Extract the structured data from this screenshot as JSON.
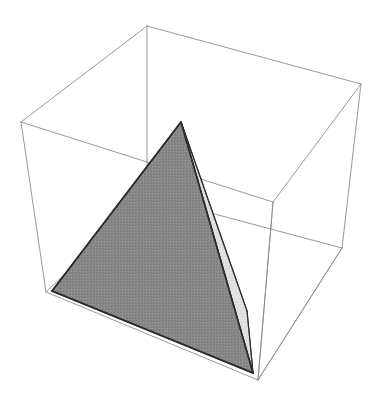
{
  "figure": {
    "title": "Tetrahedron inscribed in a wireframe bounding box",
    "type": "3d-geometry-render",
    "canvas": {
      "width": 381,
      "height": 401,
      "background": "#ffffff"
    },
    "colors": {
      "background": "#ffffff",
      "wireframe_stroke": "#8d8d8d",
      "solid_outline": "#2b2b2b",
      "face_dark_fill": "#848484",
      "face_light_fill": "#e9e9e9",
      "face_mid_fill": "#d2d2d2"
    },
    "stroke_widths": {
      "wireframe": 0.9,
      "solid_outline": 1.5
    },
    "bounding_box": {
      "name": "wireframe-cube",
      "vertices": {
        "top_back": [
          147,
          26
        ],
        "top_left": [
          21,
          122
        ],
        "top_right": [
          361,
          84
        ],
        "top_front": [
          273,
          202
        ],
        "bottom_left": [
          46,
          292
        ],
        "bottom_right": [
          342,
          248
        ],
        "bottom_front": [
          258,
          380
        ],
        "bottom_back": [
          147,
          196
        ]
      },
      "edges": [
        [
          "top_back",
          "top_left"
        ],
        [
          "top_back",
          "top_right"
        ],
        [
          "top_left",
          "top_front"
        ],
        [
          "top_right",
          "top_front"
        ],
        [
          "top_left",
          "bottom_left"
        ],
        [
          "top_right",
          "bottom_right"
        ],
        [
          "top_front",
          "bottom_front"
        ],
        [
          "bottom_left",
          "bottom_front"
        ],
        [
          "bottom_right",
          "bottom_front"
        ],
        [
          "top_back",
          "bottom_back"
        ],
        [
          "bottom_back",
          "bottom_left"
        ],
        [
          "bottom_back",
          "bottom_right"
        ]
      ]
    },
    "tetrahedron": {
      "name": "shaded-tetrahedron",
      "vertices": {
        "apex": [
          181,
          122
        ],
        "base_left": [
          52,
          291
        ],
        "base_front": [
          253,
          373
        ],
        "base_right": [
          247,
          311
        ]
      },
      "faces": [
        {
          "name": "face-front-left",
          "shade": "dark",
          "points": [
            [
              181,
              122
            ],
            [
              52,
              291
            ],
            [
              253,
              373
            ]
          ]
        },
        {
          "name": "face-right",
          "shade": "light",
          "points": [
            [
              181,
              122
            ],
            [
              253,
              373
            ],
            [
              247,
              311
            ]
          ]
        },
        {
          "name": "face-right-inner",
          "shade": "mid",
          "points": [
            [
              181,
              122
            ],
            [
              247,
              311
            ],
            [
              253,
              373
            ]
          ]
        }
      ],
      "visible_edges": [
        [
          [
            181,
            122
          ],
          [
            52,
            291
          ]
        ],
        [
          [
            52,
            291
          ],
          [
            253,
            373
          ]
        ],
        [
          [
            181,
            122
          ],
          [
            253,
            373
          ]
        ],
        [
          [
            181,
            122
          ],
          [
            247,
            311
          ]
        ],
        [
          [
            247,
            311
          ],
          [
            253,
            373
          ]
        ]
      ]
    }
  },
  "chart_data": {
    "type": "scatter",
    "title": "Tetrahedron inscribed in a wireframe bounding box",
    "xlabel": "",
    "ylabel": "",
    "series": [
      {
        "name": "cube-vertices",
        "x": [
          147,
          21,
          361,
          273,
          46,
          342,
          258,
          147
        ],
        "y": [
          26,
          122,
          84,
          202,
          292,
          248,
          380,
          196
        ]
      },
      {
        "name": "tetrahedron-vertices",
        "x": [
          181,
          52,
          253,
          247
        ],
        "y": [
          122,
          291,
          373,
          311
        ]
      }
    ]
  }
}
